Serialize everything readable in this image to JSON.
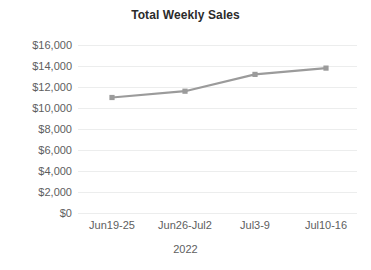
{
  "chart_data": {
    "type": "line",
    "title": "Total Weekly Sales",
    "xlabel": "2022",
    "ylabel": "",
    "categories": [
      "Jun19-25",
      "Jun26-Jul2",
      "Jul3-9",
      "Jul10-16"
    ],
    "values": [
      11000,
      11600,
      13200,
      13800
    ],
    "series": [
      {
        "name": "Total Weekly Sales",
        "values": [
          11000,
          11600,
          13200,
          13800
        ]
      }
    ],
    "ylim": [
      0,
      16000
    ],
    "y_ticks": [
      16000,
      14000,
      12000,
      10000,
      8000,
      6000,
      4000,
      2000,
      0
    ],
    "y_tick_labels": [
      "$16,000",
      "$14,000",
      "$12,000",
      "$10,000",
      "$8,000",
      "$6,000",
      "$4,000",
      "$2,000",
      "$0"
    ],
    "grid": true,
    "legend": "none",
    "line_color": "#9b9b9b",
    "marker": "square",
    "marker_color": "#9b9b9b",
    "grid_color": "#eceded",
    "tick_label_color": "#5e5e5e",
    "title_color": "#2b2b2b",
    "background_color": "#ffffff"
  }
}
